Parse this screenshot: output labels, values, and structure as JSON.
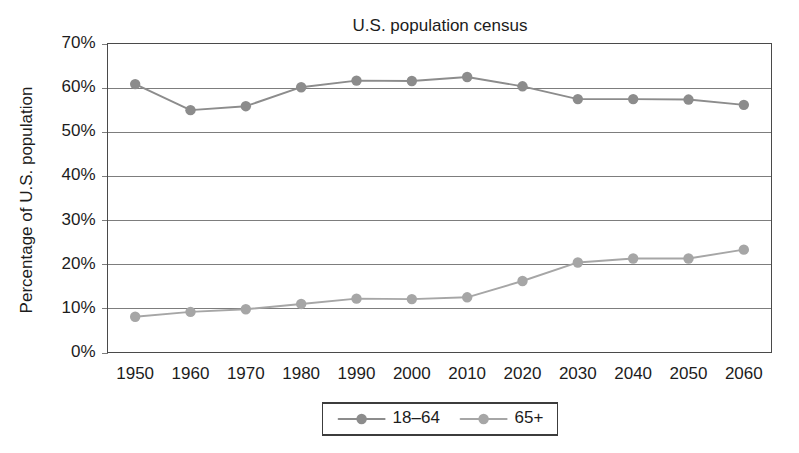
{
  "chart_data": {
    "type": "line",
    "title": "U.S. population census",
    "xlabel": "",
    "ylabel": "Percentage of U.S. population",
    "categories": [
      "1950",
      "1960",
      "1970",
      "1980",
      "1990",
      "2000",
      "2010",
      "2020",
      "2030",
      "2040",
      "2050",
      "2060"
    ],
    "x": [
      1950,
      1960,
      1970,
      1980,
      1990,
      2000,
      2010,
      2020,
      2030,
      2040,
      2050,
      2060
    ],
    "series": [
      {
        "name": "18–64",
        "color": "#8c8c8c",
        "values": [
          60.8,
          54.9,
          55.8,
          60.1,
          61.6,
          61.5,
          62.4,
          60.3,
          57.4,
          57.4,
          57.3,
          56.1
        ]
      },
      {
        "name": "65+",
        "color": "#a6a6a6",
        "values": [
          8.1,
          9.2,
          9.8,
          11.0,
          12.2,
          12.1,
          12.5,
          16.2,
          20.4,
          21.3,
          21.3,
          23.3
        ]
      }
    ],
    "ylim": [
      0,
      70
    ],
    "ytick_values": [
      0,
      10,
      20,
      30,
      40,
      50,
      60,
      70
    ],
    "ytick_labels": [
      "0%",
      "10%",
      "20%",
      "30%",
      "40%",
      "50%",
      "60%",
      "70%"
    ],
    "grid": "horizontal",
    "legend_position": "bottom",
    "legend_entries": [
      "18–64",
      "65+"
    ]
  },
  "figure": {
    "background_color": "#ffffff",
    "frame_color": "#4a4a4a",
    "gridline_color": "#7d7d7d",
    "text_color": "#1c1c1c"
  }
}
